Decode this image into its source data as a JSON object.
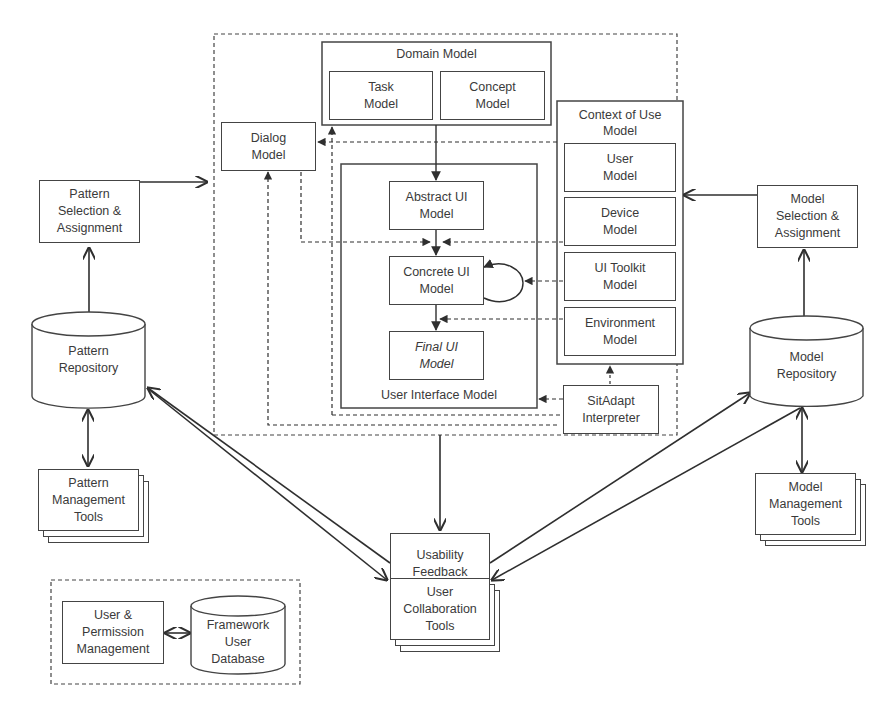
{
  "diagram": {
    "domain_model": {
      "title": "Domain Model",
      "task": "Task Model",
      "concept": "Concept Model"
    },
    "dialog_model": "Dialog Model",
    "context_of_use": {
      "title": "Context of Use Model",
      "user": "User Model",
      "device": "Device Model",
      "ui_toolkit": "UI Toolkit Model",
      "environment": "Environment Model"
    },
    "ui_model": {
      "title": "User Interface Model",
      "abstract": "Abstract UI Model",
      "concrete": "Concrete UI Model",
      "final": "Final UI Model"
    },
    "sitadapt": "SitAdapt Interpreter",
    "pattern_selection": "Pattern Selection & Assignment",
    "pattern_repository": "Pattern Repository",
    "pattern_tools": "Pattern Management Tools",
    "model_selection": "Model Selection & Assignment",
    "model_repository": "Model Repository",
    "model_tools": "Model Management Tools",
    "usability_feedback": "Usability Feedback",
    "user_collab": "User Collaboration Tools",
    "user_permission": "User & Permission Management",
    "framework_db": "Framework User Database"
  },
  "colors": {
    "line": "#2f2f2f",
    "text": "#3a3a3a",
    "background": "#ffffff"
  }
}
